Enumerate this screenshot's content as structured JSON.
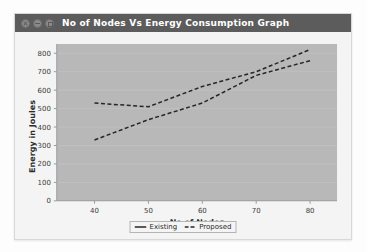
{
  "window": {
    "title": "No of Nodes Vs Energy Consumption Graph",
    "controls": [
      {
        "name": "close-button",
        "label": "Close"
      },
      {
        "name": "minimize-button",
        "label": "Minimize"
      },
      {
        "name": "maximize-button",
        "label": "Maximize"
      }
    ]
  },
  "chart_data": {
    "type": "line",
    "title": "No of Nodes Vs Energy Consumption Graph",
    "xlabel": "No of Nodes",
    "ylabel": "Energy in Joules",
    "x": [
      40,
      50,
      60,
      70,
      80
    ],
    "xticks": [
      "40",
      "50",
      "60",
      "70",
      "80"
    ],
    "yticks": [
      "0",
      "100",
      "200",
      "300",
      "400",
      "500",
      "600",
      "700",
      "800"
    ],
    "xlim": [
      33,
      85
    ],
    "ylim": [
      0,
      850
    ],
    "grid": true,
    "legend_position": "bottom-center",
    "plot_background": "#b8b8b8",
    "series": [
      {
        "name": "Existing",
        "style": "dashed",
        "color": "#262626",
        "values": [
          530,
          510,
          620,
          700,
          820
        ]
      },
      {
        "name": "Proposed",
        "style": "dashed",
        "color": "#262626",
        "values": [
          330,
          440,
          530,
          680,
          760
        ]
      }
    ]
  },
  "legend": {
    "items": [
      {
        "label": "Existing",
        "style": "solid"
      },
      {
        "label": "Proposed",
        "style": "dashed"
      }
    ]
  }
}
